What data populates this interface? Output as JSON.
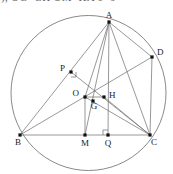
{
  "header": {
    "formula_line": "),  OG=GH    OM=HA    6+6",
    "clipped": true
  },
  "figure": {
    "type": "euclidean-geometry-diagram",
    "stroke_color": "#6b6b6b",
    "point_color": "#111111",
    "background": "#ffffff",
    "circle": {
      "label": "circumcircle",
      "cx": 88.5,
      "cy": 84.0,
      "r": 77.5
    },
    "points": [
      {
        "id": "A",
        "label": "A",
        "x": 109,
        "y": 13,
        "label_dx": 0,
        "label_dy": -4,
        "anchor": "middle"
      },
      {
        "id": "D",
        "label": "D",
        "x": 152,
        "y": 48,
        "label_dx": 5,
        "label_dy": -2,
        "anchor": "start"
      },
      {
        "id": "P",
        "label": "P",
        "x": 71,
        "y": 63,
        "label_dx": -6,
        "label_dy": -1,
        "anchor": "end"
      },
      {
        "id": "O",
        "label": "O",
        "x": 85,
        "y": 88,
        "label_dx": -6,
        "label_dy": -1,
        "anchor": "end"
      },
      {
        "id": "H",
        "label": "H",
        "x": 104,
        "y": 88,
        "label_dx": 5,
        "label_dy": 1,
        "anchor": "start"
      },
      {
        "id": "G",
        "label": "G",
        "x": 93,
        "y": 92,
        "label_dx": 1,
        "label_dy": 8,
        "anchor": "middle"
      },
      {
        "id": "B",
        "label": "B",
        "x": 20,
        "y": 126,
        "label_dx": -2,
        "label_dy": 10,
        "anchor": "middle"
      },
      {
        "id": "M",
        "label": "M",
        "x": 85,
        "y": 126,
        "label_dx": 0,
        "label_dy": 11,
        "anchor": "middle"
      },
      {
        "id": "Q",
        "label": "Q",
        "x": 108,
        "y": 126,
        "label_dx": 0,
        "label_dy": 11,
        "anchor": "middle"
      },
      {
        "id": "C",
        "label": "C",
        "x": 150,
        "y": 126,
        "label_dx": 4,
        "label_dy": 10,
        "anchor": "middle"
      }
    ],
    "segments": [
      {
        "name": "AB",
        "from": "A",
        "to": "B"
      },
      {
        "name": "AC",
        "from": "A",
        "to": "C"
      },
      {
        "name": "BC",
        "from": "B",
        "to": "C"
      },
      {
        "name": "AQ",
        "from": "A",
        "to": "Q"
      },
      {
        "name": "AM",
        "from": "A",
        "to": "M"
      },
      {
        "name": "AD",
        "from": "A",
        "to": "D"
      },
      {
        "name": "DC",
        "from": "D",
        "to": "C"
      },
      {
        "name": "BD",
        "from": "B",
        "to": "D"
      },
      {
        "name": "PC",
        "from": "P",
        "to": "C"
      },
      {
        "name": "OM",
        "from": "O",
        "to": "M"
      },
      {
        "name": "OH",
        "from": "O",
        "to": "H"
      },
      {
        "name": "HC",
        "from": "H",
        "to": "C"
      },
      {
        "name": "AO",
        "from": "A",
        "to": "O"
      },
      {
        "name": "OC",
        "from": "O",
        "to": "C"
      }
    ],
    "right_angle_marks": [
      {
        "name": "right-angle-at-Q",
        "x": 108,
        "y": 126,
        "size": 5,
        "dir_x": -1,
        "dir_y": -1
      },
      {
        "name": "right-angle-at-P",
        "x": 71,
        "y": 63,
        "size": 5,
        "dir_x": 1,
        "dir_y": 1
      }
    ]
  }
}
